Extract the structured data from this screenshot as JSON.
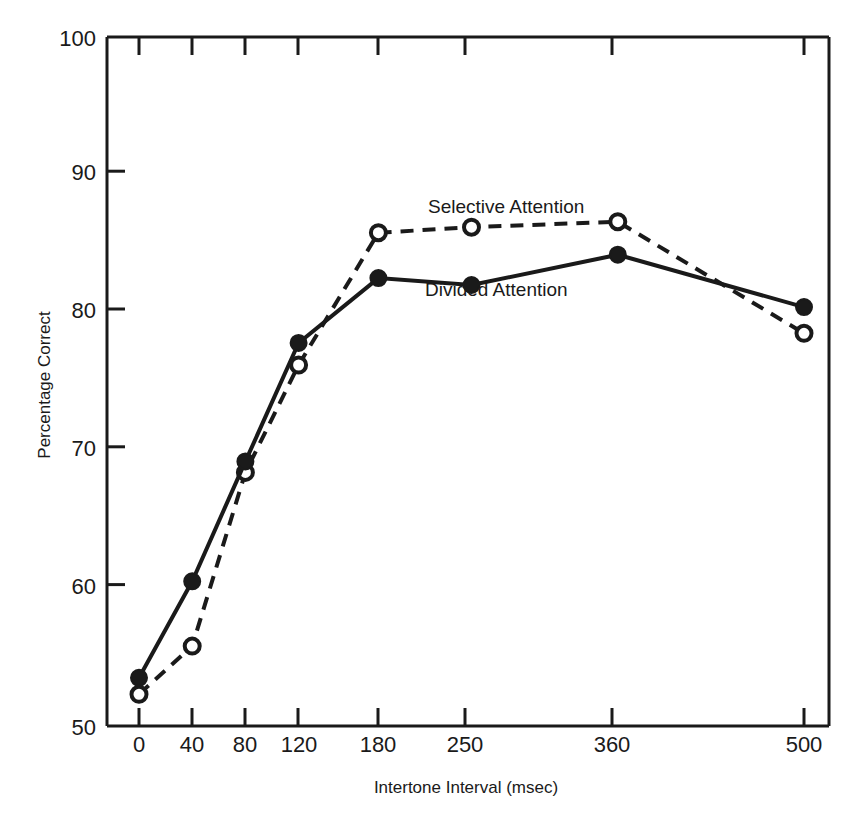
{
  "chart_data": {
    "type": "line",
    "title": "",
    "xlabel": "Intertone Interval (msec)",
    "ylabel": "Percentage Correct",
    "x": [
      0,
      40,
      80,
      120,
      180,
      250,
      360,
      500
    ],
    "categories": [
      "0",
      "40",
      "80",
      "120",
      "180",
      "250",
      "360",
      "500"
    ],
    "xtick_labels": [
      "0",
      "40",
      "80",
      "120",
      "180",
      "250",
      "360",
      "500"
    ],
    "ytick_labels": [
      "50",
      "60",
      "70",
      "80",
      "90",
      "100"
    ],
    "yticks": [
      50,
      60,
      70,
      80,
      90,
      100
    ],
    "xlim": [
      -20,
      530
    ],
    "ylim": [
      50,
      100
    ],
    "grid": false,
    "legend_position": "inline-annotation",
    "series": [
      {
        "name": "Selective Attention",
        "values": [
          52.3,
          55.8,
          68.4,
          76.2,
          85.8,
          86.2,
          86.6,
          78.5
        ],
        "line_style": "dashed",
        "marker": "open-circle",
        "color": "#1a1a1a",
        "label_x": 180,
        "label_y": 88.6
      },
      {
        "name": "Divided Attention",
        "values": [
          53.5,
          60.5,
          69.2,
          77.8,
          82.5,
          82.0,
          84.2,
          80.4
        ],
        "line_style": "solid",
        "marker": "filled-circle",
        "color": "#1a1a1a",
        "label_x": 190,
        "label_y": 80.3
      }
    ]
  },
  "annotations": {
    "selective_label": "Selective Attention",
    "divided_label": "Divided Attention"
  },
  "axes": {
    "x_title": "Intertone Interval (msec)",
    "y_title": "Percentage Correct",
    "y_tick_100": "100",
    "y_tick_90": "90",
    "y_tick_80": "80",
    "y_tick_70": "70",
    "y_tick_60": "60",
    "y_tick_50": "50",
    "x_tick_0": "0",
    "x_tick_40": "40",
    "x_tick_80": "80",
    "x_tick_120": "120",
    "x_tick_180": "180",
    "x_tick_250": "250",
    "x_tick_360": "360",
    "x_tick_500": "500"
  },
  "style": {
    "ink_color": "#1a1a1a",
    "background": "#ffffff"
  }
}
